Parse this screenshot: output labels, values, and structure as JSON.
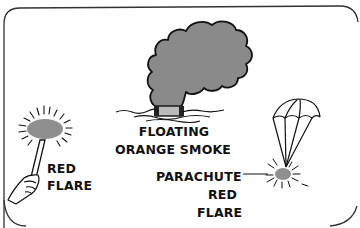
{
  "illustration": {
    "subject": "visual distress signals",
    "colors": {
      "outline": "#111111",
      "smoke_fill": "#8a8a8a",
      "flare_fill": "#8f8f8f",
      "background": "#ffffff"
    }
  },
  "labels": {
    "red_flare": [
      "RED",
      "FLARE"
    ],
    "floating_smoke": [
      "FLOATING",
      "ORANGE SMOKE"
    ],
    "parachute_flare": [
      "PARACHUTE",
      "RED",
      "FLARE"
    ]
  }
}
